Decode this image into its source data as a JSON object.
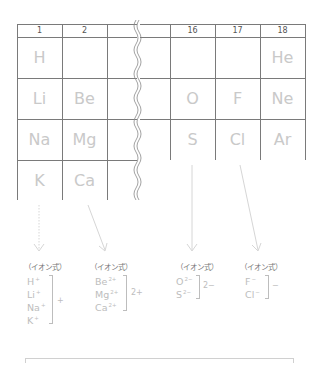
{
  "table": {
    "left_groups": [
      "1",
      "2",
      ""
    ],
    "right_groups": [
      "16",
      "17",
      "18"
    ],
    "left_cells": [
      [
        "H",
        "",
        ""
      ],
      [
        "Li",
        "Be",
        ""
      ],
      [
        "Na",
        "Mg",
        ""
      ],
      [
        "K",
        "Ca",
        ""
      ]
    ],
    "right_cells": [
      [
        "",
        "",
        "He"
      ],
      [
        "O",
        "F",
        "Ne"
      ],
      [
        "S",
        "Cl",
        "Ar"
      ]
    ]
  },
  "ion_groups": [
    {
      "label": "（イオン式）",
      "ions": [
        {
          "sym": "H",
          "charge": "+"
        },
        {
          "sym": "Li",
          "charge": "+"
        },
        {
          "sym": "Na",
          "charge": "+"
        },
        {
          "sym": "K",
          "charge": "+"
        }
      ],
      "bracket_charge": "+"
    },
    {
      "label": "（イオン式）",
      "ions": [
        {
          "sym": "Be",
          "charge": "2+"
        },
        {
          "sym": "Mg",
          "charge": "2+"
        },
        {
          "sym": "Ca",
          "charge": "2+"
        }
      ],
      "bracket_charge": "2+"
    },
    {
      "label": "（イオン式）",
      "ions": [
        {
          "sym": "O",
          "charge": "2−"
        },
        {
          "sym": "S",
          "charge": "2−"
        }
      ],
      "bracket_charge": "2−"
    },
    {
      "label": "（イオン式）",
      "ions": [
        {
          "sym": "F",
          "charge": "−"
        },
        {
          "sym": "Cl",
          "charge": "−"
        }
      ],
      "bracket_charge": "−"
    }
  ],
  "colors": {
    "grid": "#7a7a7a",
    "element_text": "#c9c9c9",
    "ion_text": "#bdbdbd",
    "arrow": "#d8d8d8"
  }
}
